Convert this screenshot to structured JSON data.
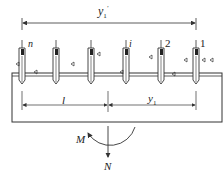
{
  "diagram": {
    "type": "pile-group-foundation",
    "dimension_top": {
      "label": "y",
      "sub": "1",
      "prime": "′"
    },
    "piles": [
      {
        "label": "n",
        "x": 22
      },
      {
        "label": "",
        "x": 56
      },
      {
        "label": "",
        "x": 91
      },
      {
        "label": "i",
        "x": 126
      },
      {
        "label": "2",
        "x": 161
      },
      {
        "label": "1",
        "x": 196
      }
    ],
    "dimension_l": {
      "label": "l"
    },
    "dimension_y1": {
      "label": "y",
      "sub": "1"
    },
    "moment_label": "M",
    "axial_label": "N",
    "colors": {
      "line": "#333333",
      "pile_fill": "#ffffff",
      "pile_head": "#222222"
    }
  }
}
